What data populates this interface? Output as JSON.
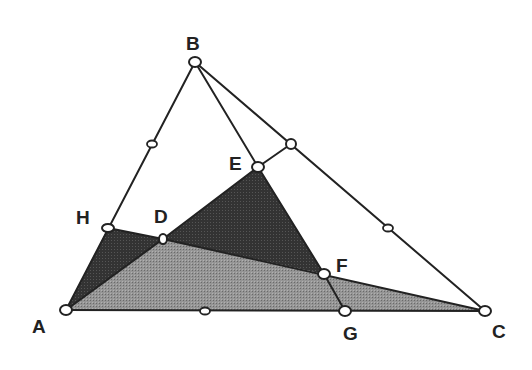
{
  "diagram": {
    "type": "geometry-triangle",
    "colors": {
      "background": "#ffffff",
      "stroke": "#222222",
      "dark_fill": "#3a3a3a",
      "light_fill": "#8c8c8c",
      "label": "#222222"
    },
    "points": [
      {
        "id": "A",
        "label": "A"
      },
      {
        "id": "B",
        "label": "B"
      },
      {
        "id": "C",
        "label": "C"
      },
      {
        "id": "D",
        "label": "D"
      },
      {
        "id": "E",
        "label": "E"
      },
      {
        "id": "F",
        "label": "F"
      },
      {
        "id": "G",
        "label": "G"
      },
      {
        "id": "H",
        "label": "H"
      }
    ],
    "segments": [
      [
        "A",
        "B"
      ],
      [
        "B",
        "C"
      ],
      [
        "A",
        "C"
      ],
      [
        "B",
        "E"
      ],
      [
        "E",
        "M_BC"
      ],
      [
        "H",
        "D"
      ],
      [
        "D",
        "E"
      ],
      [
        "E",
        "F"
      ],
      [
        "D",
        "C"
      ],
      [
        "A",
        "D"
      ],
      [
        "F",
        "G"
      ]
    ],
    "midpoint_markers": [
      "AB",
      "BC",
      "AC",
      "BC_upper"
    ],
    "shaded_regions": [
      {
        "name": "triangle-AHD",
        "vertices": [
          "A",
          "H",
          "D"
        ],
        "shade": "dark"
      },
      {
        "name": "triangle-DEF",
        "vertices": [
          "D",
          "E",
          "F"
        ],
        "shade": "dark"
      },
      {
        "name": "triangle-ADC",
        "vertices": [
          "A",
          "D",
          "C"
        ],
        "shade": "light"
      }
    ]
  }
}
